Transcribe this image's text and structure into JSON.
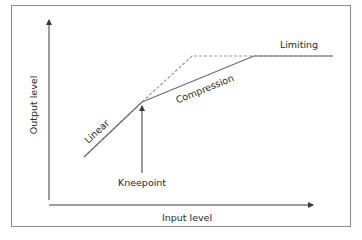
{
  "diagram": {
    "type": "compressor transfer curve",
    "axes": {
      "x_label": "Input level",
      "y_label": "Output level"
    },
    "curves": [
      {
        "name": "dashed-reference",
        "style": "dashed",
        "description": "Linear 1:1 line extended to the limit"
      },
      {
        "name": "solid-response",
        "style": "solid",
        "description": "Linear then compression then limiting"
      }
    ],
    "annotations": {
      "linear": "Linear",
      "compression": "Compression",
      "limiting": "Limiting",
      "kneepoint": "Kneepoint"
    },
    "colors": {
      "line": "#6e6e6e",
      "dashed": "#9a9a9a",
      "axis": "#3a3a3a",
      "text": "#2a2a2a",
      "frame": "#8a8a8a"
    }
  }
}
